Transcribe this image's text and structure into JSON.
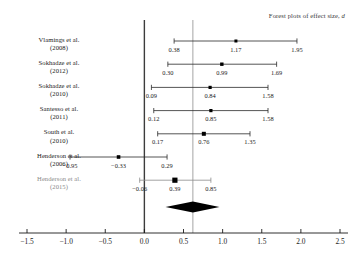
{
  "chart_data": {
    "type": "forest",
    "title": "Forest plots of effect size, d",
    "title_plain": "Forest plots of effect size,",
    "title_italic": "d",
    "xlabel": "",
    "ylabel": "",
    "xlim": [
      -1.75,
      2.65
    ],
    "xticks": [
      -1.5,
      -1.0,
      -0.5,
      0.0,
      0.5,
      1.0,
      1.5,
      2.0,
      2.5
    ],
    "xtick_labels": [
      "−1.5",
      "−1.0",
      "−0.5",
      "0.0",
      "0.5",
      "1.0",
      "1.5",
      "2.0",
      "2.5"
    ],
    "grid": false,
    "null_line": 0.0,
    "pooled_line": 0.62,
    "studies": [
      {
        "label_line1": "Vlamings et al.",
        "label_line2": "(2008)",
        "lower": 0.38,
        "effect": 1.17,
        "upper": 1.95,
        "lower_label": "0.38",
        "effect_label": "1.17",
        "upper_label": "1.95",
        "marker": 3.0,
        "muted": false
      },
      {
        "label_line1": "Sokhadze et al.",
        "label_line2": "(2012)",
        "lower": 0.3,
        "effect": 0.99,
        "upper": 1.69,
        "lower_label": "0.30",
        "effect_label": "0.99",
        "upper_label": "1.69",
        "marker": 3.4,
        "muted": false
      },
      {
        "label_line1": "Sokhadze et al.",
        "label_line2": "(2010)",
        "lower": 0.09,
        "effect": 0.84,
        "upper": 1.58,
        "lower_label": "0.09",
        "effect_label": "0.84",
        "upper_label": "1.58",
        "marker": 3.2,
        "muted": false
      },
      {
        "label_line1": "Santesso et al.",
        "label_line2": "(2011)",
        "lower": 0.12,
        "effect": 0.85,
        "upper": 1.58,
        "lower_label": "0.12",
        "effect_label": "0.85",
        "upper_label": "1.58",
        "marker": 3.2,
        "muted": false
      },
      {
        "label_line1": "South et al.",
        "label_line2": "(2010)",
        "lower": 0.17,
        "effect": 0.76,
        "upper": 1.35,
        "lower_label": "0.17",
        "effect_label": "0.76",
        "upper_label": "1.35",
        "marker": 4.0,
        "muted": false
      },
      {
        "label_line1": "Henderson et al.",
        "label_line2": "(2006)",
        "lower": -0.95,
        "effect": -0.33,
        "upper": 0.29,
        "lower_label": "−0.95",
        "effect_label": "−0.33",
        "upper_label": "0.29",
        "marker": 3.6,
        "muted": false
      },
      {
        "label_line1": "Henderson et al.",
        "label_line2": "(2015)",
        "lower": -0.06,
        "effect": 0.39,
        "upper": 0.85,
        "lower_label": "−0.06",
        "effect_label": "0.39",
        "upper_label": "0.85",
        "marker": 5.2,
        "muted": true
      }
    ],
    "summary": {
      "center": 0.62,
      "lower": 0.27,
      "upper": 0.96
    }
  },
  "colors": {
    "ink": "#1a1a1a",
    "muted": "#8a8a8a",
    "null_line": "#3c3c3c",
    "pooled_line": "#9a9a9a",
    "whisker": "#2a2a2a",
    "diamond": "#000000"
  }
}
